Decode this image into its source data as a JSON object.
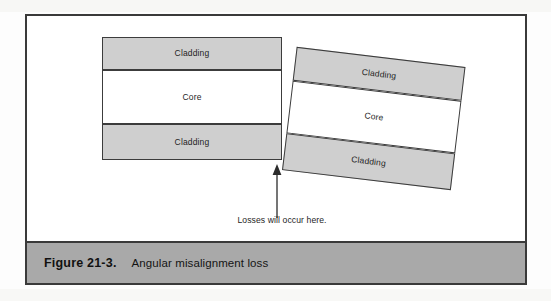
{
  "figure": {
    "caption_number": "Figure 21-3.",
    "caption_title": "Angular misalignment loss",
    "annotation": "Losses will occur here.",
    "colors": {
      "cladding_fill": "#cfcfcf",
      "core_fill": "#ffffff",
      "stroke": "#3c3c3c",
      "caption_bar": "#a9a9a9",
      "frame": "#3a3a3a",
      "page_background": "#ffffff"
    },
    "fibers": [
      {
        "id": "left",
        "name": "aligned-fiber",
        "rotation_deg": 0,
        "layers": [
          {
            "label": "Cladding",
            "type": "cladding"
          },
          {
            "label": "Core",
            "type": "core"
          },
          {
            "label": "Cladding",
            "type": "cladding"
          }
        ]
      },
      {
        "id": "right",
        "name": "misaligned-fiber",
        "rotation_deg": 6.8,
        "layers": [
          {
            "label": "Cladding",
            "type": "cladding"
          },
          {
            "label": "Core",
            "type": "core"
          },
          {
            "label": "Cladding",
            "type": "cladding"
          }
        ]
      }
    ]
  }
}
